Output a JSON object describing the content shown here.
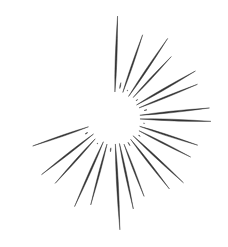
{
  "artwork": {
    "title": "Starburst",
    "subject": "hand-drawn radiating sunburst / explosion star",
    "style": "ink sketch, tapered spindle rays, hollow center",
    "canvas": {
      "width": 228,
      "height": 247,
      "background_color": "#ffffff"
    },
    "stroke_color": "#333333",
    "center": {
      "x": 114,
      "y": 118
    },
    "inner_radius": 28,
    "ray_count": 30
  },
  "chart_data": {
    "type": "scatter",
    "xlabel": "",
    "ylabel": "",
    "grid": false,
    "legend": null,
    "center": {
      "x": 114,
      "y": 118
    },
    "background_color": "#ffffff",
    "stroke_color": "#333333",
    "inner_radius": 28,
    "categories": [
      "ray-00",
      "ray-01",
      "ray-02",
      "ray-03",
      "ray-04",
      "ray-05",
      "ray-06",
      "ray-07",
      "ray-08",
      "ray-09",
      "ray-10",
      "ray-11",
      "ray-12",
      "ray-13",
      "ray-14",
      "ray-15",
      "ray-16",
      "ray-17",
      "ray-18",
      "ray-19",
      "ray-20",
      "ray-21",
      "ray-22",
      "ray-23",
      "ray-24",
      "ray-25",
      "ray-26",
      "ray-27",
      "ray-28",
      "ray-29"
    ],
    "series": [
      {
        "name": "angle_deg",
        "values": [
          272,
          281,
          289,
          296,
          304,
          313,
          322,
          330,
          338,
          346,
          354,
          2,
          10,
          18,
          27,
          35,
          43,
          52,
          60,
          69,
          78,
          87,
          96,
          105,
          114,
          123,
          132,
          142,
          151,
          161
        ]
      },
      {
        "name": "outer_radius_px",
        "values": [
          102,
          36,
          88,
          30,
          96,
          84,
          28,
          94,
          90,
          34,
          96,
          97,
          30,
          88,
          86,
          32,
          95,
          90,
          28,
          84,
          93,
          112,
          34,
          90,
          97,
          30,
          88,
          92,
          33,
          86
        ]
      },
      {
        "name": "inner_radius_px",
        "values": [
          26,
          30,
          27,
          31,
          26,
          28,
          30,
          26,
          27,
          31,
          26,
          26,
          31,
          27,
          28,
          30,
          26,
          27,
          32,
          28,
          26,
          26,
          30,
          27,
          26,
          31,
          28,
          26,
          30,
          27
        ]
      },
      {
        "name": "thickness_px",
        "values": [
          3.4,
          1.5,
          2.8,
          1.2,
          3.0,
          2.6,
          1.1,
          3.2,
          2.7,
          1.3,
          3.1,
          3.3,
          1.2,
          2.8,
          2.6,
          1.2,
          3.0,
          2.9,
          1.1,
          2.5,
          3.0,
          3.6,
          1.3,
          2.8,
          3.1,
          1.2,
          2.7,
          2.9,
          1.3,
          2.6
        ]
      }
    ]
  }
}
